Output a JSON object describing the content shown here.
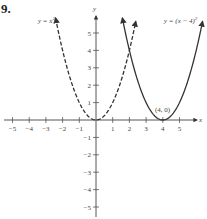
{
  "problem_number": "9.",
  "chart_data": {
    "type": "line",
    "title": "",
    "xlabel": "x",
    "ylabel": "y",
    "xlim": [
      -5.3,
      5.6
    ],
    "ylim": [
      -5.3,
      5.8
    ],
    "grid": false,
    "x_ticks": [
      "-5",
      "-4",
      "-3",
      "-2",
      "-1",
      "1",
      "2",
      "3",
      "4",
      "5"
    ],
    "y_ticks": [
      "5",
      "4",
      "3",
      "2",
      "1",
      "-1",
      "-2",
      "-3",
      "-4",
      "-5"
    ],
    "series": [
      {
        "name": "y = x^2",
        "label": "y = x²",
        "style": "dashed",
        "x": [
          -2.4,
          -2,
          -1,
          0,
          1,
          2,
          2.4
        ],
        "y": [
          5.76,
          4,
          1,
          0,
          1,
          4,
          5.76
        ]
      },
      {
        "name": "y = (x - 4)^2",
        "label": "y = (x − 4)²",
        "style": "solid",
        "x": [
          1.6,
          2,
          3,
          4,
          5,
          6,
          6.4
        ],
        "y": [
          5.76,
          4,
          1,
          0,
          1,
          4,
          5.76
        ]
      }
    ],
    "annotations": [
      {
        "text": "(4, 0)",
        "x": 4,
        "y": 0
      }
    ]
  },
  "labels": {
    "curve1": "y = x",
    "curve1_exp": "2",
    "curve2": "y = (x − 4)",
    "curve2_exp": "2",
    "vertex": "(4, 0)",
    "x_axis": "x",
    "y_axis": "y"
  }
}
